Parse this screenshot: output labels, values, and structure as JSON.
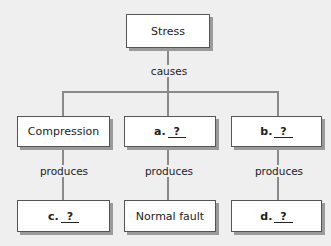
{
  "diagram": {
    "root": {
      "label": "Stress"
    },
    "root_link": "causes",
    "middle": [
      {
        "label": "Compression",
        "type": "text"
      },
      {
        "prefix": "a.",
        "blank": "?",
        "type": "question"
      },
      {
        "prefix": "b.",
        "blank": "?",
        "type": "question"
      }
    ],
    "links": [
      "produces",
      "produces",
      "produces"
    ],
    "bottom": [
      {
        "prefix": "c.",
        "blank": "?",
        "type": "question"
      },
      {
        "label": "Normal fault",
        "type": "text"
      },
      {
        "prefix": "d.",
        "blank": "?",
        "type": "question"
      }
    ]
  },
  "colors": {
    "background": "#efefef",
    "box_fill": "#ffffff",
    "box_border": "#555555",
    "shadow": "#9a9a9a",
    "connector": "#8a8a8a"
  }
}
